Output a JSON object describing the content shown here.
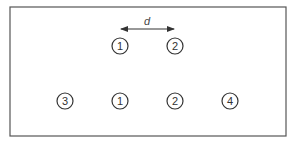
{
  "diagram": {
    "frame": {
      "x": 10,
      "y": 7,
      "width": 276,
      "height": 129,
      "stroke": "#555555"
    },
    "ink_color": "#333333",
    "distance_label": "d",
    "arrow": {
      "x1": 121,
      "x2": 174,
      "y": 29
    },
    "label_pos": {
      "x": 147,
      "y": 25
    },
    "circle_radius": 8,
    "top_row": [
      {
        "label": "1",
        "cx": 120,
        "cy": 46
      },
      {
        "label": "2",
        "cx": 175,
        "cy": 46
      }
    ],
    "bottom_row": [
      {
        "label": "3",
        "cx": 65,
        "cy": 101
      },
      {
        "label": "1",
        "cx": 120,
        "cy": 101
      },
      {
        "label": "2",
        "cx": 175,
        "cy": 101
      },
      {
        "label": "4",
        "cx": 230,
        "cy": 101
      }
    ]
  }
}
